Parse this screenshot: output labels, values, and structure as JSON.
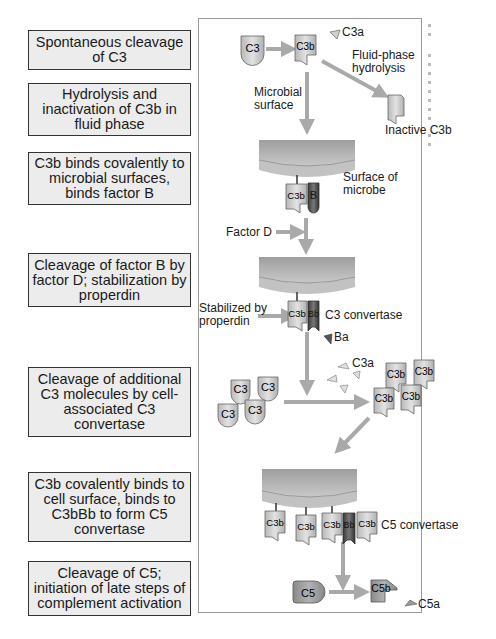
{
  "steps": [
    {
      "label": "Spontaneous cleavage of C3"
    },
    {
      "label": "Hydrolysis and inactivation of C3b in fluid phase"
    },
    {
      "label": "C3b binds covalently to microbial surfaces, binds factor B"
    },
    {
      "label": "Cleavage of factor B by factor D; stabilization by properdin"
    },
    {
      "label": "Cleavage of additional C3 molecules by cell-associated C3 convertase"
    },
    {
      "label": "C3b covalently binds to cell surface, binds to C3bBb to form C5 convertase"
    },
    {
      "label": "Cleavage of C5; initiation of late steps of complement activation"
    }
  ],
  "diagram": {
    "molecules": {
      "c3": "C3",
      "c3b": "C3b",
      "c3a": "C3a",
      "b": "B",
      "bb": "Bb",
      "ba": "Ba",
      "c5": "C5",
      "c5b": "C5b",
      "c5a": "C5a"
    },
    "labels": {
      "fluid_phase": "Fluid-phase hydrolysis",
      "fluid_phase_l1": "Fluid-phase",
      "fluid_phase_l2": "hydrolysis",
      "microbial_l1": "Microbial",
      "microbial_l2": "surface",
      "inactive_c3b": "Inactive C3b",
      "surface_l1": "Surface of",
      "surface_l2": "microbe",
      "factor_d": "Factor D",
      "properdin_l1": "Stabilized by",
      "properdin_l2": "properdin",
      "c3_convertase": "C3 convertase",
      "c5_convertase": "C5 convertase"
    }
  },
  "colors": {
    "arrow": "#a9a9a9",
    "molecule_light": "#d4d4d4",
    "molecule_dark": "#5a5a5a",
    "membrane": "#b4b4b4",
    "step_box": "#ececec"
  }
}
